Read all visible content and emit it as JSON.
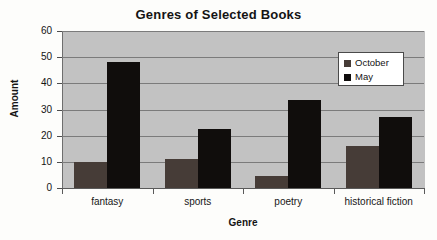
{
  "chart_data": {
    "type": "bar",
    "title": "Genres of Selected Books",
    "xlabel": "Genre",
    "ylabel": "Amount",
    "categories": [
      "fantasy",
      "sports",
      "poetry",
      "historical fiction"
    ],
    "series": [
      {
        "name": "October",
        "color": "#463c37",
        "values": [
          10,
          11,
          4.5,
          16
        ]
      },
      {
        "name": "May",
        "color": "#100d0c",
        "values": [
          48,
          22.5,
          33.5,
          27
        ]
      }
    ],
    "ylim": [
      0,
      60
    ],
    "yticks": [
      0,
      10,
      20,
      30,
      40,
      50,
      60
    ],
    "ytick_labels": [
      "0",
      "10",
      "20",
      "30",
      "40",
      "50",
      "60"
    ],
    "grid": true,
    "legend_position": "upper right",
    "plot_background": "#c2c2c2",
    "figure_background": "#fdfdfb"
  }
}
